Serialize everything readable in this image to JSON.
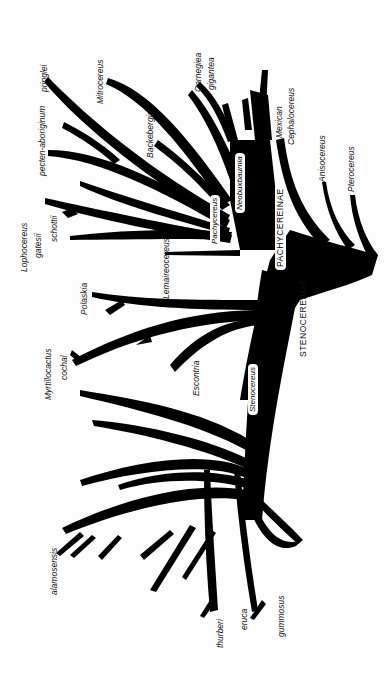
{
  "diagram": {
    "type": "phylogenetic-tree",
    "orientation": "rotated-90-counterclockwise",
    "colors": {
      "branches": "#000000",
      "background": "#fdfdfd",
      "label_box": "#ffffff"
    },
    "subtribes": {
      "pachycereinae": "PACHYCEREINAE",
      "stenocereinae": "STENOCEREINAE"
    },
    "genus_labels": {
      "neobuxbaumia": "Neobuxbaumia",
      "pachycereus": "Pachycereus",
      "stenocereus": "Stenocereus"
    },
    "taxa": {
      "lophocereus_gatesii_1": "Lophocereus",
      "lophocereus_gatesii_2": "gatesii",
      "schottii": "schottii",
      "pecten": "pecten-aboriginum",
      "pringlei": "pringlei",
      "mitrocereus": "Mitrocereus",
      "backebergia": "Backebergia",
      "carnegiea_1": "Carnegiea",
      "carnegiea_2": "gigantea",
      "mexican_1": "Mexican",
      "mexican_2": "Cephalocereus",
      "anisocereus": "Anisocereus",
      "pterocereus": "Pterocereus",
      "lemaireocereus": "Lemaireocereus",
      "polaskia": "Polaskia",
      "myrtillocactus_1": "Myrtillocactus",
      "myrtillocactus_2": "cochal",
      "escontria": "Escontria",
      "alamosensis": "alamosensis",
      "thurberi": "thurberi",
      "eruca": "eruca",
      "gummosus": "gummosus"
    }
  }
}
